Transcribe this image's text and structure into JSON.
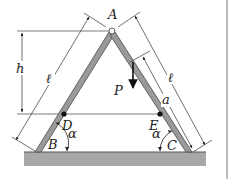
{
  "figure": {
    "type": "A-frame truss diagram",
    "points": {
      "A": "A",
      "B": "B",
      "C": "C",
      "D": "D",
      "E": "E"
    },
    "dimensions": {
      "height": "h",
      "left_length": "ℓ",
      "right_length": "ℓ",
      "segment": "a"
    },
    "load": "P",
    "angles": {
      "left": "α",
      "right": "α"
    },
    "colors": {
      "member_fill": "#9a9a9a",
      "member_edge": "#4a4a4a",
      "ground_fill": "#a8a8a8",
      "line": "#333333"
    }
  }
}
